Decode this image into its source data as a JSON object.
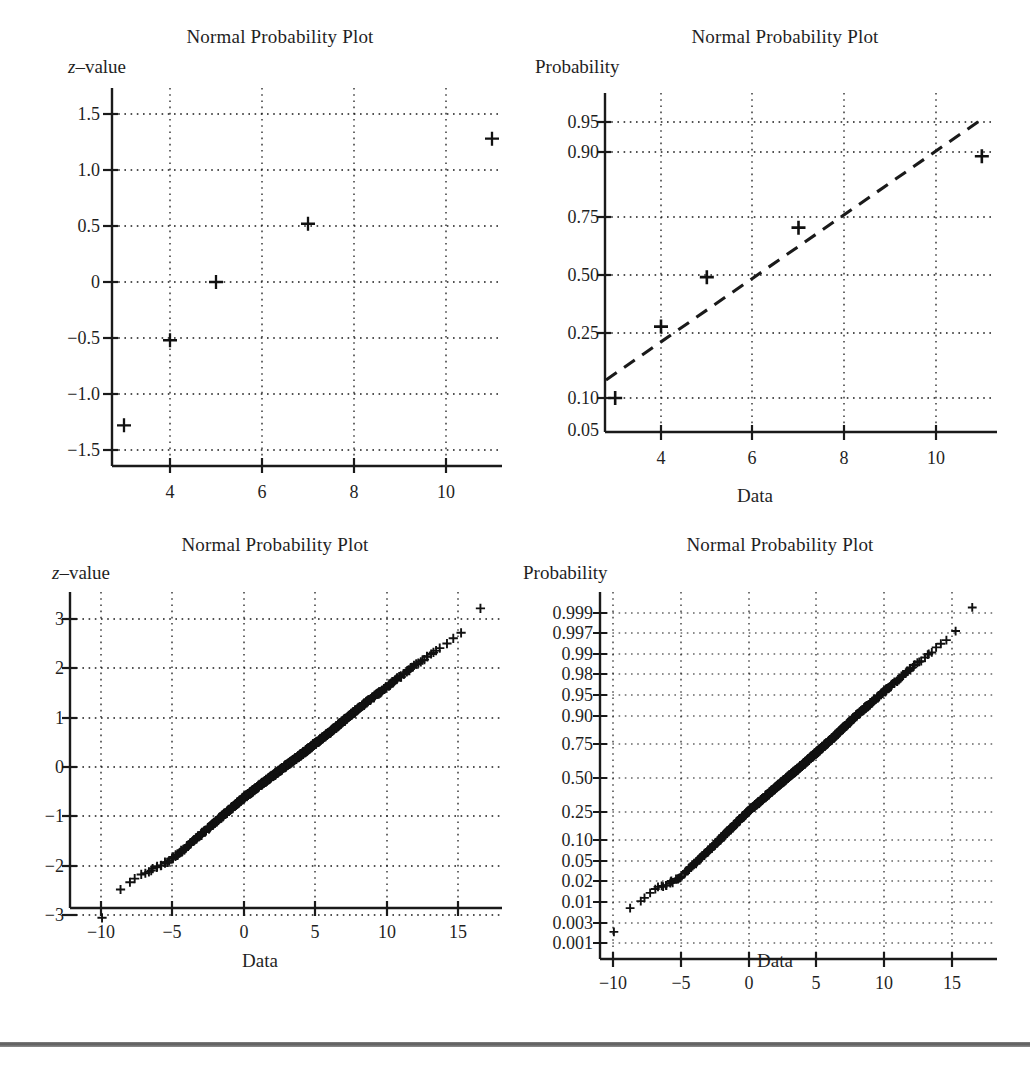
{
  "figure": {
    "background": "#ffffff",
    "ink": "#1a1a1a",
    "marker": "+",
    "grid_style": "dotted",
    "panel_count": 4
  },
  "panels": [
    {
      "id": "top-left",
      "title": "Normal Probability Plot",
      "ylabel": "z–value",
      "xlabel": "",
      "chart_data": {
        "type": "scatter",
        "title": "Normal Probability Plot",
        "xlabel": "",
        "ylabel": "z-value",
        "ylabel_display": "z–value",
        "grid": true,
        "legend": "none",
        "xlim": [
          2.7,
          11.4
        ],
        "ylim": [
          -1.75,
          1.72
        ],
        "xticks": [
          4,
          6,
          8,
          10
        ],
        "xticklabels": [
          "4",
          "6",
          "8",
          "10"
        ],
        "yticks": [
          1.5,
          1.0,
          0.5,
          0,
          -0.5,
          -1.0,
          -1.5
        ],
        "yticklabels": [
          "1.5",
          "1.0",
          "0.5",
          "0",
          "−0.5",
          "−1.0",
          "−1.5"
        ],
        "x": [
          3,
          4,
          5,
          7,
          11
        ],
        "y": [
          -1.28,
          -0.52,
          0,
          0.52,
          1.28
        ],
        "series": [
          {
            "name": "sample z-scores",
            "points": [
              {
                "x": 3,
                "y": -1.28
              },
              {
                "x": 4,
                "y": -0.52
              },
              {
                "x": 5,
                "y": 0
              },
              {
                "x": 7,
                "y": 0.52
              },
              {
                "x": 11,
                "y": 1.28
              }
            ]
          }
        ]
      }
    },
    {
      "id": "top-right",
      "title": "Normal Probability Plot",
      "ylabel": "Probability",
      "xlabel": "Data",
      "chart_data": {
        "type": "scatter",
        "title": "Normal Probability Plot",
        "xlabel": "Data",
        "ylabel": "Probability",
        "grid": true,
        "legend": "none",
        "y_scale": "normal-probability",
        "xlim": [
          2.7,
          11.4
        ],
        "ylim": [
          0.045,
          0.972
        ],
        "xticks": [
          4,
          6,
          8,
          10
        ],
        "xticklabels": [
          "4",
          "6",
          "8",
          "10"
        ],
        "yticks": [
          0.95,
          0.9,
          0.75,
          0.5,
          0.25,
          0.1,
          0.05
        ],
        "yticklabels": [
          "0.95",
          "0.90",
          "0.75",
          "0.50",
          "0.25",
          "0.10",
          "0.05"
        ],
        "x": [
          3,
          4,
          5,
          7,
          11
        ],
        "y": [
          0.1,
          0.3,
          0.5,
          0.7,
          0.9
        ],
        "series": [
          {
            "name": "sample probabilities",
            "points": [
              {
                "x": 3,
                "y": 0.1
              },
              {
                "x": 4,
                "y": 0.3
              },
              {
                "x": 5,
                "y": 0.5
              },
              {
                "x": 7,
                "y": 0.7
              },
              {
                "x": 11,
                "y": 0.9
              }
            ]
          },
          {
            "name": "reference line",
            "style": "dashed",
            "endpoints": [
              {
                "x": 2.72,
                "y": 0.145
              },
              {
                "x": 10.85,
                "y": 0.955
              }
            ]
          }
        ]
      }
    },
    {
      "id": "bottom-left",
      "title": "Normal Probability Plot",
      "ylabel": "z–value",
      "xlabel": "Data",
      "chart_data": {
        "type": "scatter",
        "title": "Normal Probability Plot",
        "xlabel": "Data",
        "ylabel": "z-value",
        "ylabel_display": "z–value",
        "grid": true,
        "legend": "none",
        "sample_size": 1000,
        "xlim": [
          -11.2,
          17.8
        ],
        "ylim": [
          -3.45,
          3.45
        ],
        "xticks": [
          -10,
          -5,
          0,
          5,
          10,
          15
        ],
        "xticklabels": [
          "−10",
          "−5",
          "0",
          "5",
          "10",
          "15"
        ],
        "yticks": [
          3,
          2,
          1,
          0,
          -1,
          -2,
          -3
        ],
        "yticklabels": [
          "3",
          "2",
          "1",
          "0",
          "−1",
          "−2",
          "−3"
        ],
        "description": "Dense near-linear band of ~1000 plus-markers running from (-10, -3.3) to (16.6, 3.25); slight flattening below z = -2 and above z = 2.",
        "anchor_points": [
          {
            "x": -10.0,
            "y": -3.3
          },
          {
            "x": -9.9,
            "y": -2.95
          },
          {
            "x": -9.4,
            "y": -2.72
          },
          {
            "x": -8.8,
            "y": -2.55
          },
          {
            "x": -8.0,
            "y": -2.35
          },
          {
            "x": -7.0,
            "y": -2.16
          },
          {
            "x": -6.0,
            "y": -2.02
          },
          {
            "x": -5.2,
            "y": -1.9
          },
          {
            "x": -4.0,
            "y": -1.62
          },
          {
            "x": -2.0,
            "y": -1.12
          },
          {
            "x": 0.0,
            "y": -0.62
          },
          {
            "x": 2.0,
            "y": -0.18
          },
          {
            "x": 4.0,
            "y": 0.25
          },
          {
            "x": 6.0,
            "y": 0.7
          },
          {
            "x": 8.0,
            "y": 1.18
          },
          {
            "x": 10.0,
            "y": 1.62
          },
          {
            "x": 12.0,
            "y": 2.06
          },
          {
            "x": 13.2,
            "y": 2.3
          },
          {
            "x": 14.2,
            "y": 2.5
          },
          {
            "x": 15.0,
            "y": 2.7
          },
          {
            "x": 15.8,
            "y": 2.85
          },
          {
            "x": 16.2,
            "y": 2.98
          },
          {
            "x": 16.6,
            "y": 3.25
          }
        ]
      }
    },
    {
      "id": "bottom-right",
      "title": "Normal Probability Plot",
      "ylabel": "Probability",
      "xlabel": "Data",
      "chart_data": {
        "type": "scatter",
        "title": "Normal Probability Plot",
        "xlabel": "Data",
        "ylabel": "Probability",
        "grid": true,
        "legend": "none",
        "y_scale": "normal-probability",
        "sample_size": 1000,
        "xlim": [
          -11.2,
          17.8
        ],
        "ylim": [
          0.0006,
          0.9994
        ],
        "xticks": [
          -10,
          -5,
          0,
          5,
          10,
          15
        ],
        "xticklabels": [
          "−10",
          "−5",
          "0",
          "5",
          "10",
          "15"
        ],
        "yticks": [
          0.999,
          0.997,
          0.99,
          0.98,
          0.95,
          0.9,
          0.75,
          0.5,
          0.25,
          0.1,
          0.05,
          0.02,
          0.01,
          0.003,
          0.001
        ],
        "yticklabels": [
          "0.999",
          "0.997",
          "0.99",
          "0.98",
          "0.95",
          "0.90",
          "0.75",
          "0.50",
          "0.25",
          "0.10",
          "0.05",
          "0.02",
          "0.01",
          "0.003",
          "0.001"
        ],
        "description": "Same ~1000-point sample plotted on a normal-probability vertical scale; the band is essentially straight from (-10, 0.001) to (16.6, 0.9994).",
        "anchor_points": [
          {
            "x": -10.0,
            "y": 0.001
          },
          {
            "x": -9.9,
            "y": 0.0028
          },
          {
            "x": -9.4,
            "y": 0.005
          },
          {
            "x": -8.8,
            "y": 0.007
          },
          {
            "x": -8.0,
            "y": 0.011
          },
          {
            "x": -7.0,
            "y": 0.018
          },
          {
            "x": -6.0,
            "y": 0.023
          },
          {
            "x": -5.2,
            "y": 0.03
          },
          {
            "x": -4.0,
            "y": 0.053
          },
          {
            "x": -2.0,
            "y": 0.131
          },
          {
            "x": 0.0,
            "y": 0.268
          },
          {
            "x": 2.0,
            "y": 0.429
          },
          {
            "x": 4.0,
            "y": 0.599
          },
          {
            "x": 6.0,
            "y": 0.758
          },
          {
            "x": 8.0,
            "y": 0.881
          },
          {
            "x": 10.0,
            "y": 0.947
          },
          {
            "x": 12.0,
            "y": 0.98
          },
          {
            "x": 13.2,
            "y": 0.9893
          },
          {
            "x": 14.2,
            "y": 0.9938
          },
          {
            "x": 15.0,
            "y": 0.9965
          },
          {
            "x": 15.8,
            "y": 0.9978
          },
          {
            "x": 16.2,
            "y": 0.9986
          },
          {
            "x": 16.6,
            "y": 0.9994
          }
        ]
      }
    }
  ]
}
